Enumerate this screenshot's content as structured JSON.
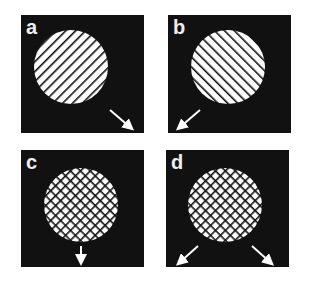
{
  "figure": {
    "background": "#ffffff",
    "panel_color": "#111111",
    "disc_color": "#ffffff",
    "line_color": "#111111",
    "panels": [
      {
        "label": "a",
        "pattern": "single-hatch",
        "hatch_direction": "down-right",
        "arrows": [
          "down-right"
        ]
      },
      {
        "label": "b",
        "pattern": "single-hatch",
        "hatch_direction": "down-left",
        "arrows": [
          "down-left"
        ]
      },
      {
        "label": "c",
        "pattern": "cross-hatch",
        "arrows": [
          "down"
        ]
      },
      {
        "label": "d",
        "pattern": "cross-hatch",
        "arrows": [
          "down-left",
          "down-right"
        ]
      }
    ]
  }
}
